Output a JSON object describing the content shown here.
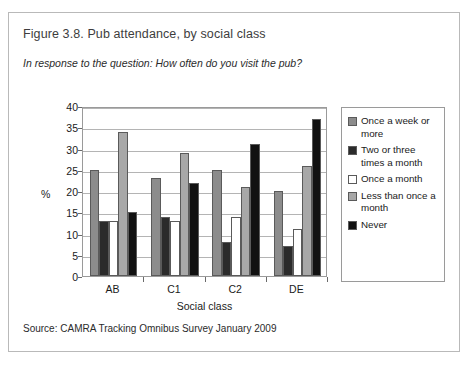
{
  "figure": {
    "title": "Figure 3.8. Pub attendance, by social class",
    "subtitle": "In response to the question: How often do you visit the pub?",
    "source": "Source: CAMRA Tracking Omnibus Survey January 2009"
  },
  "chart_data": {
    "type": "bar",
    "title": "Figure 3.8. Pub attendance, by social class",
    "subtitle": "In response to the question: How often do you visit the pub?",
    "xlabel": "Social class",
    "ylabel": "%",
    "ylim": [
      0,
      40
    ],
    "yticks": [
      0,
      5,
      10,
      15,
      20,
      25,
      30,
      35,
      40
    ],
    "grid": true,
    "legend_position": "right",
    "categories": [
      "AB",
      "C1",
      "C2",
      "DE"
    ],
    "series": [
      {
        "name": "Once a week or more",
        "color": "#8c8c8c",
        "values": [
          25,
          23,
          25,
          20
        ]
      },
      {
        "name": "Two or three times a month",
        "color": "#2b2b2b",
        "values": [
          13,
          14,
          8,
          7
        ]
      },
      {
        "name": "Once a month",
        "color": "#ffffff",
        "values": [
          13,
          13,
          14,
          11
        ]
      },
      {
        "name": "Less than once a month",
        "color": "#a8a8a8",
        "values": [
          34,
          29,
          21,
          26
        ]
      },
      {
        "name": "Never",
        "color": "#111111",
        "values": [
          15,
          22,
          31,
          37
        ]
      }
    ]
  },
  "legend": {
    "items": [
      {
        "label": "Once a week or more",
        "color": "#8c8c8c"
      },
      {
        "label": "Two or three times a month",
        "color": "#2b2b2b"
      },
      {
        "label": "Once a month",
        "color": "#ffffff"
      },
      {
        "label": "Less than once a month",
        "color": "#a8a8a8"
      },
      {
        "label": "Never",
        "color": "#111111"
      }
    ]
  }
}
